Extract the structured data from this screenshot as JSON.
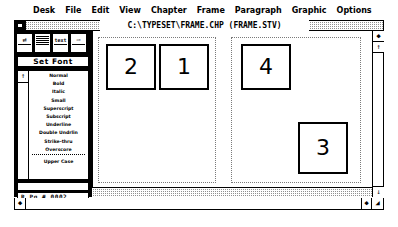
{
  "app": {
    "name": "Ventura Publisher"
  },
  "menubar": {
    "items": [
      {
        "label": "Desk",
        "name": "menu-desk"
      },
      {
        "label": "File",
        "name": "menu-file"
      },
      {
        "label": "Edit",
        "name": "menu-edit"
      },
      {
        "label": "View",
        "name": "menu-view"
      },
      {
        "label": "Chapter",
        "name": "menu-chapter"
      },
      {
        "label": "Frame",
        "name": "menu-frame"
      },
      {
        "label": "Paragraph",
        "name": "menu-paragraph"
      },
      {
        "label": "Graphic",
        "name": "menu-graphic"
      },
      {
        "label": "Options",
        "name": "menu-options"
      }
    ]
  },
  "titlebar": {
    "title": "C:\\TYPESET\\FRAME.CHP   (FRAME.STV)",
    "close_label": ""
  },
  "sidepanel": {
    "mode_icons": [
      {
        "name": "frame-mode-icon",
        "glyph": "⇄"
      },
      {
        "name": "paragraph-mode-icon",
        "glyph": ""
      },
      {
        "name": "text-mode-icon",
        "glyph": "text"
      },
      {
        "name": "graphic-mode-icon",
        "glyph": "⇨"
      }
    ],
    "set_font_label": "Set Font",
    "scroll_up_glyph": "↑",
    "attributes": [
      "Normal",
      "Bold",
      "Italic",
      "Small",
      "Superscript",
      "Subscript",
      "Underline",
      "Double Undrlin",
      "Strike-thru",
      "Overscore"
    ],
    "attributes_extra": [
      "Upper Case"
    ],
    "page_field_value": "",
    "page_number_label": "R  Pg #  0002"
  },
  "canvas": {
    "pages": [
      {
        "name": "page-left",
        "frames": [
          {
            "label": "2",
            "name": "frame-2",
            "x": 7,
            "y": 6,
            "w": 50,
            "h": 46
          },
          {
            "label": "1",
            "name": "frame-1",
            "x": 60,
            "y": 6,
            "w": 50,
            "h": 46
          }
        ]
      },
      {
        "name": "page-right",
        "frames": [
          {
            "label": "4",
            "name": "frame-4",
            "x": 9,
            "y": 6,
            "w": 50,
            "h": 46
          },
          {
            "label": "3",
            "name": "frame-3",
            "x": 66,
            "y": 84,
            "w": 50,
            "h": 52
          }
        ]
      }
    ]
  },
  "scrollbars": {
    "v_up_glyph": "◆",
    "v_up2_glyph": "↑",
    "v_down_glyph": "↓",
    "h_left_glyph": "◆",
    "h_right_glyph": "◆",
    "resize_glyph": "◢"
  },
  "colors": {
    "window_border": "#000000",
    "panel_bg": "#000000",
    "titlebar_pattern": "#909090",
    "page_border": "#7a7a7a",
    "frame_border": "#000000"
  }
}
